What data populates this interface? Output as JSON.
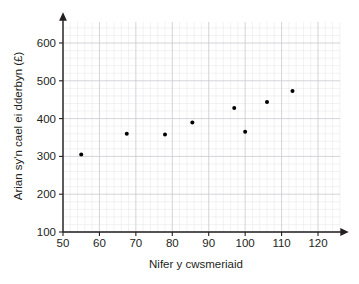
{
  "chart_data": {
    "type": "scatter",
    "title": "",
    "xlabel": "Nifer y cwsmeriaid",
    "ylabel": "Arian sy'n cael ei dderbyn (£)",
    "xlim": [
      50,
      125
    ],
    "ylim": [
      100,
      650
    ],
    "xticks": [
      50,
      60,
      70,
      80,
      90,
      100,
      110,
      120
    ],
    "yticks": [
      100,
      200,
      300,
      400,
      500,
      600
    ],
    "xticklabels": [
      "50",
      "60",
      "70",
      "80",
      "90",
      "100",
      "110",
      "120"
    ],
    "yticklabels": [
      "100",
      "200",
      "300",
      "400",
      "500",
      "600"
    ],
    "x_minor_step": 2,
    "y_minor_step": 20,
    "grid": true,
    "grid_color": "#c9c9cf",
    "minor_grid_color": "#e4e4e8",
    "legend": false,
    "marker_color": "#000000",
    "marker_size": 4,
    "points": [
      {
        "x": 55,
        "y": 305
      },
      {
        "x": 67.5,
        "y": 360
      },
      {
        "x": 78,
        "y": 358
      },
      {
        "x": 85.5,
        "y": 390
      },
      {
        "x": 97,
        "y": 428
      },
      {
        "x": 100,
        "y": 365
      },
      {
        "x": 106,
        "y": 444
      },
      {
        "x": 113,
        "y": 473
      }
    ]
  }
}
